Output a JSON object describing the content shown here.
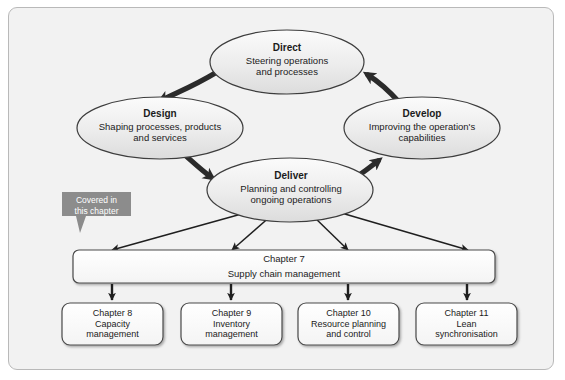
{
  "figure": {
    "background_color": "#f2f2f2",
    "border_color": "#b9b9b9"
  },
  "cycle": {
    "nodes": [
      {
        "id": "direct",
        "title": "Direct",
        "description_line1": "Steering operations",
        "description_line2": "and processes"
      },
      {
        "id": "design",
        "title": "Design",
        "description_line1": "Shaping processes, products",
        "description_line2": "and services"
      },
      {
        "id": "deliver",
        "title": "Deliver",
        "description_line1": "Planning and controlling",
        "description_line2": "ongoing operations"
      },
      {
        "id": "develop",
        "title": "Develop",
        "description_line1": "Improving the operation's",
        "description_line2": "capabilities"
      }
    ],
    "flow_order": [
      "direct",
      "design",
      "deliver",
      "develop"
    ],
    "arrow_color": "#2b2b2b"
  },
  "callout": {
    "line1": "Covered in",
    "line2": "this chapter",
    "background_color": "#8c8c8c",
    "text_color": "#ffffff"
  },
  "chapter7": {
    "heading": "Chapter 7",
    "subheading": "Supply chain management"
  },
  "chapters": [
    {
      "heading": "Chapter 8",
      "line1": "Capacity",
      "line2": "management"
    },
    {
      "heading": "Chapter 9",
      "line1": "Inventory",
      "line2": "management"
    },
    {
      "heading": "Chapter 10",
      "line1": "Resource planning",
      "line2": "and control"
    },
    {
      "heading": "Chapter 11",
      "line1": "Lean",
      "line2": "synchronisation"
    }
  ]
}
